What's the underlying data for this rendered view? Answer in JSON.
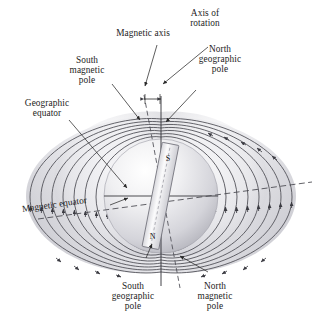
{
  "figure": {
    "background_color": "#ffffff",
    "field_line_color": "#4a4a52",
    "lobe_fill_light": "#f2f2f4",
    "lobe_fill_dark": "#c9c9cf",
    "sphere_light": "#fdfdfd",
    "sphere_dark": "#bfbfc6",
    "text_color": "#1c1c1c"
  },
  "labels": {
    "magnetic_axis": "Magnetic axis",
    "axis_of_rotation": "Axis of\nrotation",
    "south_magnetic_pole": "South\nmagnetic\npole",
    "north_geographic_pole": "North\ngeographic\npole",
    "geographic_equator": "Geographic\nequator",
    "magnetic_equator": "Magnetic equator",
    "south_geographic_pole": "South\ngeographic\npole",
    "north_magnetic_pole": "North\nmagnetic\npole"
  },
  "magnet": {
    "north_letter": "N",
    "south_letter": "S",
    "tilt_degrees": 11,
    "description": "bar magnet inside Earth, tilted from rotation axis"
  },
  "axes": {
    "rotation_axis_style": "solid",
    "magnetic_axis_style": "dashed",
    "geographic_equator_style": "solid",
    "magnetic_equator_style": "dashed"
  },
  "field": {
    "type": "magnetic-dipole",
    "lines_per_side": 9,
    "arrow_direction": "from north magnetic pole (bottom) around to south magnetic pole (top)",
    "symmetry": "left-right mirrored lobes"
  }
}
